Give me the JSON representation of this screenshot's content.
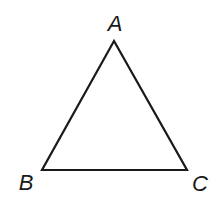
{
  "diagram": {
    "type": "triangle",
    "stroke_color": "#1a1a1a",
    "stroke_width": 2.2,
    "vertices": [
      {
        "name": "A",
        "x": 114,
        "y": 41,
        "label_x": 115,
        "label_y": 31
      },
      {
        "name": "B",
        "x": 42,
        "y": 170,
        "label_x": 26,
        "label_y": 190
      },
      {
        "name": "C",
        "x": 187,
        "y": 170,
        "label_x": 200,
        "label_y": 191
      }
    ],
    "labels": {
      "a": "A",
      "b": "B",
      "c": "C"
    }
  }
}
